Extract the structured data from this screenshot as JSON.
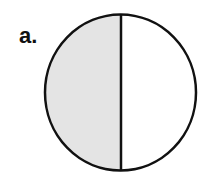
{
  "figure": {
    "label": "a.",
    "circle": {
      "left_half": "shaded",
      "right_half": "unshaded",
      "divider": "vertical"
    },
    "colors": {
      "stroke": "#111111",
      "shaded_fill": "#e4e4e4",
      "unshaded_fill": "#ffffff"
    }
  }
}
